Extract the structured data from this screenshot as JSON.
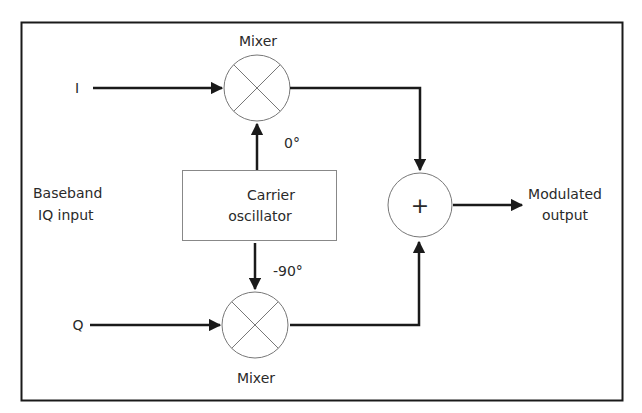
{
  "diagram": {
    "type": "block-diagram",
    "labels": {
      "mixer_top": "Mixer",
      "mixer_bottom": "Mixer",
      "input_i": "I",
      "input_q": "Q",
      "baseband_line1": "Baseband",
      "baseband_line2": "IQ input",
      "phase_top": "0°",
      "phase_bottom": "-90°",
      "oscillator_line1": "Carrier",
      "oscillator_line2": "oscillator",
      "summer_symbol": "+",
      "output_line1": "Modulated",
      "output_line2": "output"
    },
    "nodes": [
      {
        "id": "mixer_i",
        "kind": "mixer",
        "label": "Mixer"
      },
      {
        "id": "mixer_q",
        "kind": "mixer",
        "label": "Mixer"
      },
      {
        "id": "oscillator",
        "kind": "block",
        "label": "Carrier oscillator"
      },
      {
        "id": "summer",
        "kind": "summer",
        "label": "+"
      }
    ],
    "edges": [
      {
        "from": "I",
        "to": "mixer_i"
      },
      {
        "from": "Q",
        "to": "mixer_q"
      },
      {
        "from": "oscillator",
        "to": "mixer_i",
        "label": "0°"
      },
      {
        "from": "oscillator",
        "to": "mixer_q",
        "label": "-90°"
      },
      {
        "from": "mixer_i",
        "to": "summer"
      },
      {
        "from": "mixer_q",
        "to": "summer"
      },
      {
        "from": "summer",
        "to": "Modulated output"
      }
    ],
    "colors": {
      "line": "#1a1a1a",
      "thin_line": "#777777",
      "text": "#2a2a2a",
      "background": "#ffffff"
    }
  }
}
